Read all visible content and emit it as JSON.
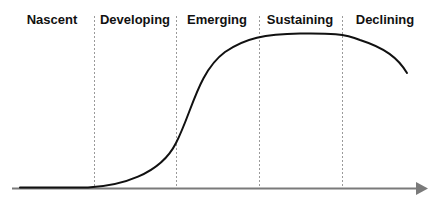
{
  "diagram": {
    "title": "",
    "type": "lifecycle-s-curve",
    "stages": [
      {
        "label": "Nascent",
        "center_x": 52
      },
      {
        "label": "Developing",
        "center_x": 135
      },
      {
        "label": "Emerging",
        "center_x": 217
      },
      {
        "label": "Sustaining",
        "center_x": 300
      },
      {
        "label": "Declining",
        "center_x": 385
      }
    ],
    "dividers_x": [
      94,
      176,
      259,
      342
    ],
    "colors": {
      "curve": "#111111",
      "axis": "#7a7a7a",
      "divider": "#9a9a9a",
      "text": "#111111"
    }
  }
}
